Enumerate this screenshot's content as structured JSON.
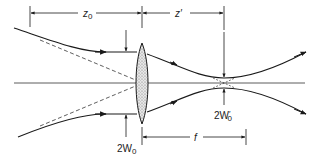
{
  "diagram": {
    "labels": {
      "z0": "z",
      "z0_sub": "0",
      "zprime": "z′",
      "w0_in": "2W",
      "w0_in_sub": "0",
      "w0_out": "2W",
      "w0_out_prime": "′",
      "w0_out_sub": "0",
      "focal": "f"
    },
    "elements": [
      "input-beam",
      "thin-lens",
      "focused-beam-waist",
      "optical-axis",
      "asymptote-dashed-lines"
    ],
    "colors": {
      "line": "#1a1a1a",
      "lens_fill": "#d8d8d8"
    }
  }
}
